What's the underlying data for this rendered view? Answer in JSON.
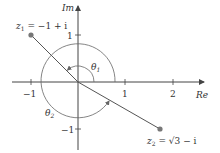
{
  "diagram": {
    "type": "complex-plane",
    "axes": {
      "real_label": "Re",
      "imag_label": "Im",
      "real_ticks": [
        "−1",
        "1",
        "2"
      ],
      "imag_ticks": [
        "1",
        "−1"
      ]
    },
    "points": [
      {
        "id": "z1",
        "name": "z",
        "sub": "1",
        "expr": " = −1 + i",
        "re": -1,
        "im": 1
      },
      {
        "id": "z2",
        "name": "z",
        "sub": "2",
        "expr_pre": " = ",
        "sqrt": "√3",
        "expr_post": " − i",
        "re": 1.732,
        "im": -1
      }
    ],
    "angles": [
      {
        "id": "theta1",
        "symbol": "θ",
        "sub": "1",
        "target": "z1",
        "degrees": 135
      },
      {
        "id": "theta2",
        "symbol": "θ",
        "sub": "2",
        "target": "z2",
        "degrees": 330
      }
    ],
    "colors": {
      "line": "#555555",
      "point": "#777777",
      "text": "#333333"
    }
  }
}
